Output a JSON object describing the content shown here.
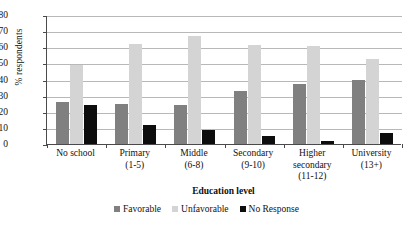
{
  "chart_data": {
    "type": "bar",
    "title": "",
    "xlabel": "Education level",
    "ylabel": "% respondents",
    "ylim": [
      0,
      80
    ],
    "ytick_step": 10,
    "yticks": [
      80,
      70,
      60,
      50,
      40,
      30,
      20,
      10,
      0
    ],
    "grid": true,
    "legend_position": "bottom",
    "categories": [
      "No school",
      "Primary (1-5)",
      "Middle (6-8)",
      "Secondary (9-10)",
      "Higher secondary (11-12)",
      "University (13+)"
    ],
    "category_lines": [
      [
        "No school"
      ],
      [
        "Primary",
        "(1-5)"
      ],
      [
        "Middle",
        "(6-8)"
      ],
      [
        "Secondary",
        "(9-10)"
      ],
      [
        "Higher",
        "secondary",
        "(11-12)"
      ],
      [
        "University",
        "(13+)"
      ]
    ],
    "series": [
      {
        "name": "Favorable",
        "color": "#808080",
        "values": [
          26,
          25,
          24,
          33,
          37,
          40
        ]
      },
      {
        "name": "Unfavorable",
        "color": "#d4d4d4",
        "values": [
          49,
          62,
          67,
          61.5,
          60.5,
          53
        ]
      },
      {
        "name": "No Response",
        "color": "#0d0d0d",
        "values": [
          24,
          12,
          8.5,
          5,
          2,
          7
        ]
      }
    ]
  },
  "legend": {
    "items": [
      {
        "label": "Favorable"
      },
      {
        "label": "Unfavorable"
      },
      {
        "label": "No Response"
      }
    ]
  }
}
